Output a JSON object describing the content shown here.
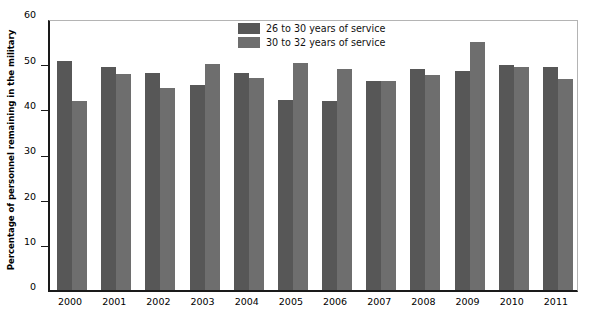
{
  "chart_data": {
    "type": "bar",
    "title": "",
    "subtitle": "",
    "xlabel": "",
    "ylabel": "Percentage of personnel remaining in the military",
    "ylim": [
      0,
      60
    ],
    "yticks": [
      0,
      10,
      20,
      30,
      40,
      50,
      60
    ],
    "ytick_labels": [
      "0",
      "10",
      "20",
      "30",
      "40",
      "50",
      "60"
    ],
    "grid": false,
    "legend_position": "top-center",
    "categories": [
      "2000",
      "2001",
      "2002",
      "2003",
      "2004",
      "2005",
      "2006",
      "2007",
      "2008",
      "2009",
      "2010",
      "2011"
    ],
    "series": [
      {
        "name": "26 to 30 years of service",
        "color": "#575757",
        "values": [
          50.6,
          49.3,
          47.9,
          45.3,
          47.8,
          42.0,
          41.8,
          46.0,
          48.8,
          48.4,
          49.6,
          49.1
        ]
      },
      {
        "name": "30 to 32 years of service",
        "color": "#6e6e6e",
        "values": [
          41.6,
          47.6,
          44.5,
          49.9,
          46.8,
          50.1,
          48.7,
          46.2,
          47.5,
          54.7,
          49.1,
          46.5
        ]
      }
    ]
  },
  "axis": {
    "y_title": "Percentage of personnel remaining in the military"
  },
  "legend": {
    "items": [
      {
        "label": "26 to 30 years of service",
        "swatch": "legend-swatch-dark"
      },
      {
        "label": "30 to 32 years of service",
        "swatch": "legend-swatch-light"
      }
    ]
  }
}
